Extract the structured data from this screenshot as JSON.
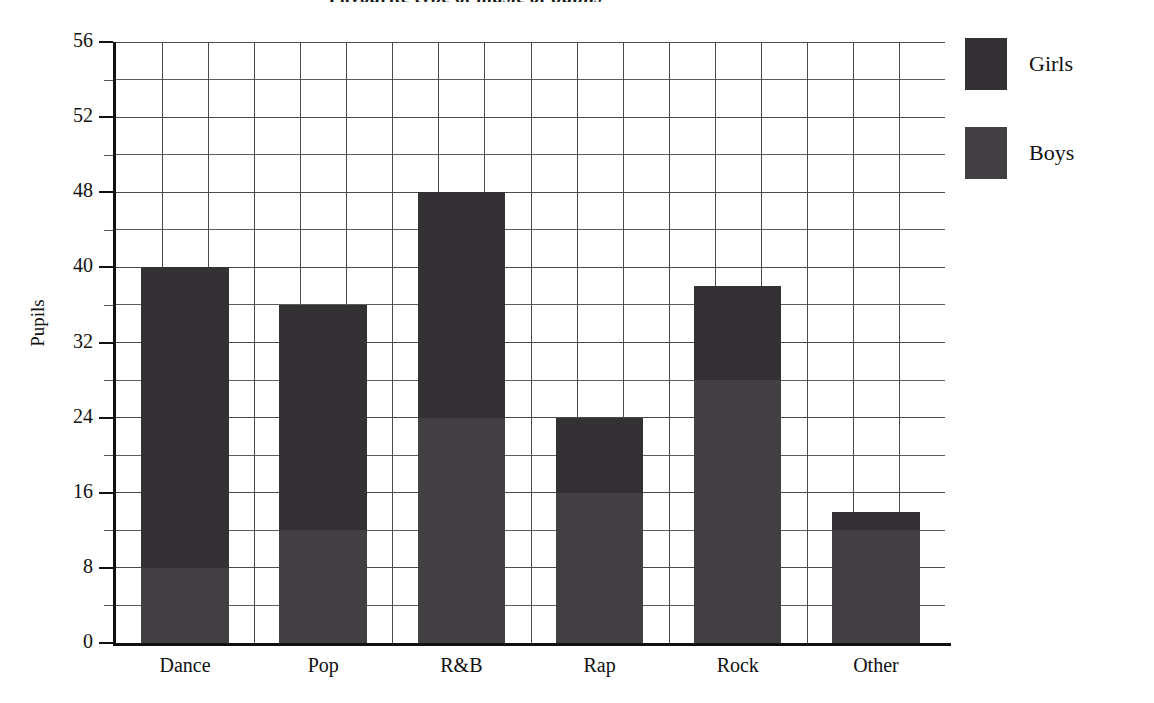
{
  "chart_data": {
    "type": "bar",
    "subtype": "stacked-bar",
    "title": "Favourite type of music of pupils",
    "xlabel": "",
    "ylabel": "Pupils",
    "categories": [
      "Dance",
      "Pop",
      "R&B",
      "Rap",
      "Rock",
      "Other"
    ],
    "series": [
      {
        "name": "Boys",
        "values": [
          8,
          12,
          24,
          16,
          28,
          12
        ]
      },
      {
        "name": "Girls",
        "values": [
          32,
          24,
          24,
          8,
          10,
          2
        ]
      }
    ],
    "totals": [
      40,
      36,
      48,
      24,
      38,
      14
    ],
    "stack_order": [
      "Boys",
      "Girls"
    ],
    "ylim": [
      0,
      56
    ],
    "ytick_labels": [
      "0",
      "8",
      "16",
      "24",
      "32",
      "40",
      "48",
      "52",
      "56"
    ],
    "ytick_values": [
      0,
      8,
      16,
      24,
      32,
      40,
      48,
      52,
      56
    ],
    "minor_gridlines_between_major_ticks": 1,
    "grid": true,
    "legend_position": "right",
    "legend_entries": [
      "Girls",
      "Boys"
    ],
    "colors": {
      "girls": "#333133",
      "boys": "#424042",
      "grid": "#4a4a4a",
      "axis": "#111111",
      "background": "#ffffff"
    }
  },
  "legend": {
    "items": [
      {
        "label": "Girls",
        "swatch": "girls"
      },
      {
        "label": "Boys",
        "swatch": "boys"
      }
    ]
  }
}
